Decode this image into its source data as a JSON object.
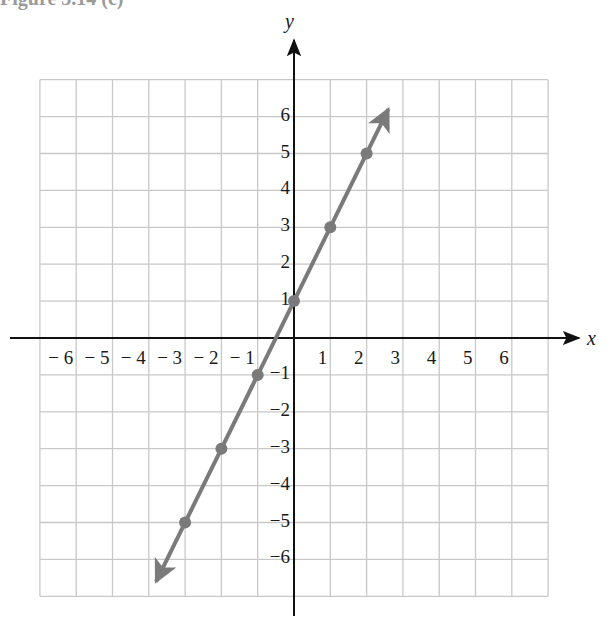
{
  "figure": {
    "title_partial": "Figure 3.14 (c)"
  },
  "chart_data": {
    "type": "line",
    "title": "",
    "equation": "y = 2x + 1",
    "xlabel": "x",
    "ylabel": "y",
    "xlim": [
      -7,
      7
    ],
    "ylim": [
      -7,
      7
    ],
    "grid": true,
    "x_ticks": [
      -6,
      -5,
      -4,
      -3,
      -2,
      -1,
      1,
      2,
      3,
      4,
      5,
      6
    ],
    "y_ticks": [
      -6,
      -5,
      -4,
      -3,
      -2,
      -1,
      1,
      2,
      3,
      4,
      5,
      6
    ],
    "series": [
      {
        "name": "y = 2x + 1",
        "color": "#7a7a7a",
        "arrows_both_ends": true,
        "points": [
          {
            "x": -3,
            "y": -5
          },
          {
            "x": -2,
            "y": -3
          },
          {
            "x": -1,
            "y": -1
          },
          {
            "x": 0,
            "y": 1
          },
          {
            "x": 1,
            "y": 3
          },
          {
            "x": 2,
            "y": 5
          }
        ],
        "line_extent": {
          "x_start": -3.8,
          "y_start": -6.6,
          "x_end": 2.6,
          "y_end": 6.2
        }
      }
    ]
  }
}
